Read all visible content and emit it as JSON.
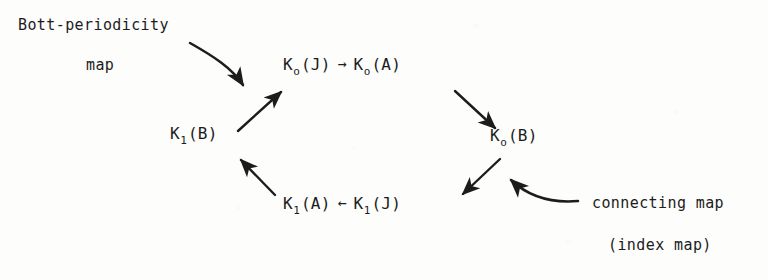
{
  "figure": {
    "type": "commutative-diagram",
    "ink_color": "#1c1c1c",
    "background_color": "#fdfdfc"
  },
  "annotations": {
    "bott_line1": "Bott-periodicity",
    "bott_line2": "map",
    "connecting_line1": "connecting map",
    "connecting_line2": "(index map)"
  },
  "nodes": {
    "k0j": {
      "base": "K",
      "sub": "o",
      "arg": "(J)"
    },
    "k0a": {
      "base": "K",
      "sub": "o",
      "arg": "(A)"
    },
    "k0b": {
      "base": "K",
      "sub": "o",
      "arg": "(B)"
    },
    "k1j": {
      "base": "K",
      "sub": "1",
      "arg": "(J)"
    },
    "k1a": {
      "base": "K",
      "sub": "1",
      "arg": "(A)"
    },
    "k1b": {
      "base": "K",
      "sub": "1",
      "arg": "(B)"
    }
  },
  "inline_arrows": {
    "top_right": "→",
    "bottom_left": "←"
  },
  "edges": [
    {
      "name": "k0j-to-k0a",
      "from": "k0j",
      "to": "k0a",
      "style": "inline-straight-right"
    },
    {
      "name": "k0a-to-k0b",
      "from": "k0a",
      "to": "k0b",
      "style": "diagonal-down-right"
    },
    {
      "name": "k0b-to-k1j",
      "from": "k0b",
      "to": "k1j",
      "style": "diagonal-down-left"
    },
    {
      "name": "k1j-to-k1a",
      "from": "k1j",
      "to": "k1a",
      "style": "inline-straight-left"
    },
    {
      "name": "k1a-to-k1b",
      "from": "k1a",
      "to": "k1b",
      "style": "diagonal-up-left"
    },
    {
      "name": "k1b-to-k0j",
      "from": "k1b",
      "to": "k0j",
      "style": "diagonal-up-right"
    },
    {
      "name": "bott-callout",
      "from": "bott_label",
      "to": "k1b-to-k0j",
      "style": "curved-down-right"
    },
    {
      "name": "connecting-callout",
      "from": "connecting_label",
      "to": "k0b-to-k1j",
      "style": "curved-up-left"
    }
  ]
}
